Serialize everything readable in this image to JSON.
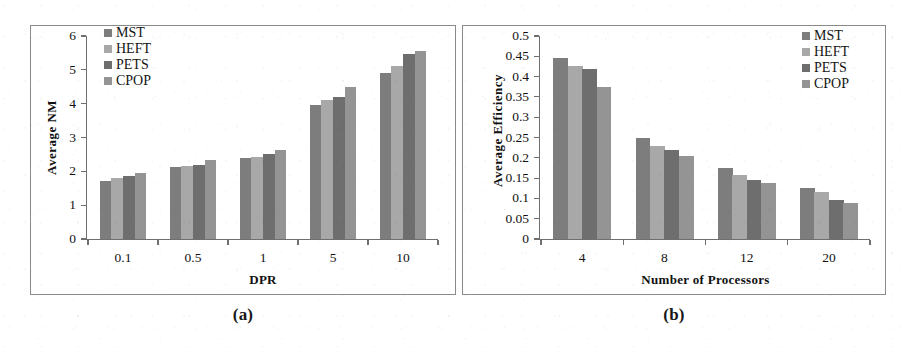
{
  "figure": {
    "series_names": [
      "MST",
      "HEFT",
      "PETS",
      "CPOP"
    ],
    "series_colors": [
      "#7d7d7d",
      "#a8a8a8",
      "#6e6e6e",
      "#949494"
    ]
  },
  "panel_a": {
    "caption": "(a)",
    "legend": [
      {
        "label": "MST",
        "color": "#7d7d7d"
      },
      {
        "label": "HEFT",
        "color": "#a8a8a8"
      },
      {
        "label": "PETS",
        "color": "#6e6e6e"
      },
      {
        "label": "CPOP",
        "color": "#949494"
      }
    ],
    "ytick_labels": [
      "0",
      "1",
      "2",
      "3",
      "4",
      "5",
      "6"
    ],
    "xtick_labels": [
      "0.1",
      "0.5",
      "1",
      "5",
      "10"
    ]
  },
  "panel_b": {
    "caption": "(b)",
    "legend": [
      {
        "label": "MST",
        "color": "#7d7d7d"
      },
      {
        "label": "HEFT",
        "color": "#a8a8a8"
      },
      {
        "label": "PETS",
        "color": "#6e6e6e"
      },
      {
        "label": "CPOP",
        "color": "#949494"
      }
    ],
    "ytick_labels": [
      "0",
      "0.05",
      "0.1",
      "0.15",
      "0.2",
      "0.25",
      "0.3",
      "0.35",
      "0.4",
      "0.45",
      "0.5"
    ],
    "xtick_labels": [
      "4",
      "8",
      "12",
      "20"
    ]
  },
  "chart_data": [
    {
      "type": "bar",
      "panel": "(a)",
      "title": "",
      "xlabel": "DPR",
      "ylabel": "Average  NM",
      "categories": [
        "0.1",
        "0.5",
        "1",
        "5",
        "10"
      ],
      "series": [
        {
          "name": "MST",
          "color": "#7d7d7d",
          "values": [
            1.7,
            2.13,
            2.4,
            3.95,
            4.9
          ]
        },
        {
          "name": "HEFT",
          "color": "#a8a8a8",
          "values": [
            1.79,
            2.16,
            2.43,
            4.12,
            5.12
          ]
        },
        {
          "name": "PETS",
          "color": "#6e6e6e",
          "values": [
            1.86,
            2.19,
            2.52,
            4.2,
            5.46
          ]
        },
        {
          "name": "CPOP",
          "color": "#949494",
          "values": [
            1.96,
            2.33,
            2.62,
            4.48,
            5.57
          ]
        }
      ],
      "ylim": [
        0,
        6
      ],
      "ytick_step": 1,
      "grid": false,
      "legend_position": "top-left"
    },
    {
      "type": "bar",
      "panel": "(b)",
      "title": "",
      "xlabel": "Number of Processors",
      "ylabel": "Average Efficiency",
      "categories": [
        "4",
        "8",
        "12",
        "20"
      ],
      "series": [
        {
          "name": "MST",
          "color": "#7d7d7d",
          "values": [
            0.447,
            0.249,
            0.176,
            0.125
          ]
        },
        {
          "name": "HEFT",
          "color": "#a8a8a8",
          "values": [
            0.425,
            0.23,
            0.157,
            0.115
          ]
        },
        {
          "name": "PETS",
          "color": "#6e6e6e",
          "values": [
            0.418,
            0.219,
            0.146,
            0.095
          ]
        },
        {
          "name": "CPOP",
          "color": "#949494",
          "values": [
            0.375,
            0.205,
            0.137,
            0.089
          ]
        }
      ],
      "ylim": [
        0,
        0.5
      ],
      "ytick_step": 0.05,
      "grid": false,
      "legend_position": "top-right"
    }
  ]
}
